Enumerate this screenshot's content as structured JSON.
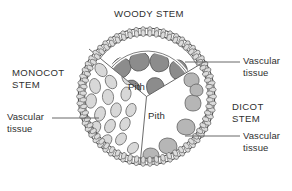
{
  "diagram": {
    "title": "WOODY STEM",
    "labels": {
      "monocot_stem": "MONOCOT\nSTEM",
      "dicot_stem": "DICOT\nSTEM",
      "vascular_tissue_top_right": "Vascular\ntissue",
      "vascular_tissue_bottom_right": "Vascular\ntissue",
      "vascular_tissue_left": "Vascular\ntissue",
      "pith_upper": "Pith",
      "pith_lower": "Pith"
    },
    "colors": {
      "outline": "#4a4a4a",
      "background": "#ffffff",
      "epidermis_cell_fill": "#d9d9d9",
      "woody_bundle_fill": "#8e8e8e",
      "dicot_bundle_fill": "#b4b4b4",
      "monocot_bundle_fill": "#d6d6d6",
      "leader_line": "#555555",
      "text": "#2f2f2f"
    },
    "regions": [
      {
        "name": "woody-stem-sector",
        "label": "WOODY STEM",
        "bundle_count": 6,
        "bundle_shade": "dark",
        "pith_label": "Pith"
      },
      {
        "name": "monocot-stem-sector",
        "label": "MONOCOT STEM",
        "bundle_count": 18,
        "bundle_shade": "light",
        "pith_label": ""
      },
      {
        "name": "dicot-stem-sector",
        "label": "DICOT STEM",
        "bundle_count": 7,
        "bundle_shade": "medium",
        "pith_label": "Pith"
      }
    ]
  }
}
